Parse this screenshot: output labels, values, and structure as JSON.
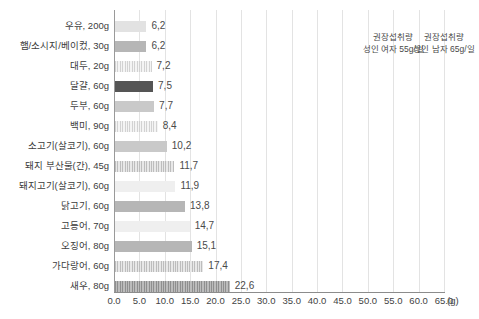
{
  "chart_data": {
    "type": "bar",
    "orientation": "horizontal",
    "title": "",
    "xlabel": "(g)",
    "ylabel": "",
    "xlim": [
      0.0,
      65.0
    ],
    "xticks": [
      "0.0",
      "5.0",
      "10.0",
      "15.0",
      "20.0",
      "25.0",
      "30.0",
      "35.0",
      "40.0",
      "45.0",
      "50.0",
      "55.0",
      "60.0",
      "65.0"
    ],
    "xtick_values": [
      0,
      5,
      10,
      15,
      20,
      25,
      30,
      35,
      40,
      45,
      50,
      55,
      60,
      65
    ],
    "grid": true,
    "legend": "none",
    "categories": [
      "우유, 200g",
      "햄/소시지/베이컸, 30g",
      "대두, 20g",
      "달걀, 60g",
      "두부, 60g",
      "백미, 90g",
      "소고기(살코기), 60g",
      "돼지 부산물(간), 45g",
      "돼지고기(살코기), 60g",
      "닭고기, 60g",
      "고등어, 70g",
      "오징어, 80g",
      "가다랑어, 60g",
      "새우, 80g"
    ],
    "values": [
      6.2,
      6.2,
      7.2,
      7.5,
      7.7,
      8.4,
      10.2,
      11.7,
      11.9,
      13.8,
      14.7,
      15.1,
      17.4,
      22.6
    ],
    "value_labels": [
      "6,2",
      "6,2",
      "7,2",
      "7,5",
      "7,7",
      "8,4",
      "10,2",
      "11,7",
      "11,9",
      "13,8",
      "14,7",
      "15,1",
      "17,4",
      "22,6"
    ],
    "bar_styles": [
      "fill-light",
      "fill-mid",
      "fill-hatch-light",
      "fill-dark",
      "fill-mid2",
      "fill-hatch-light",
      "fill-mid2",
      "fill-hatch-mid",
      "fill-vlight",
      "fill-mid",
      "fill-vlight",
      "fill-mid",
      "fill-hatch-mid",
      "fill-hatch-dark"
    ],
    "annotations": [
      {
        "at_value": 55,
        "line1": "권장섭취량",
        "line2": "성인 여자 55g/일"
      },
      {
        "at_value": 65,
        "line1": "권장섭취량",
        "line2": "성인 남자 65g/일"
      }
    ],
    "colors": {
      "grid": "#e3e3e3",
      "axis": "#8c8c8c",
      "text": "#3a3a3a",
      "bar_dark": "#555555",
      "bar_mid": "#b6b6b6",
      "bar_light": "#e2e2e2"
    }
  }
}
